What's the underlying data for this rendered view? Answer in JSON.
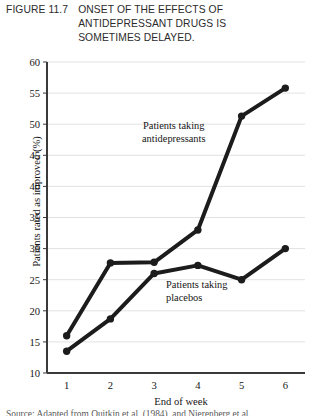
{
  "figure": {
    "number": "FIGURE 11.7",
    "title_lines": [
      "ONSET OF THE EFFECTS OF",
      "ANTIDEPRESSANT DRUGS IS",
      "SOMETIMES DELAYED."
    ]
  },
  "annotations": {
    "antidepressants_line1": "Patients taking",
    "antidepressants_line2": "antidepressants",
    "placebos_line1": "Patients taking",
    "placebos_line2": "placebos"
  },
  "source_credit": "Source: Adapted from Quitkin et al. (1984), and Nierenberg et al.",
  "colors": {
    "line": "#1c1c1c",
    "gridline": "#e2e2e2",
    "axis": "#3a3a3a",
    "text": "#161616",
    "background": "#ffffff"
  },
  "chart_data": {
    "type": "line",
    "title": "ONSET OF THE EFFECTS OF ANTIDEPRESSANT DRUGS IS SOMETIMES DELAYED.",
    "xlabel": "End of week",
    "ylabel": "Patients rated as improved (%)",
    "x": [
      1,
      2,
      3,
      4,
      5,
      6
    ],
    "xticklabels": [
      "1",
      "2",
      "3",
      "4",
      "5",
      "6"
    ],
    "yticks": [
      10,
      15,
      20,
      25,
      30,
      35,
      40,
      45,
      50,
      55,
      60
    ],
    "yticklabels": [
      "10",
      "15",
      "20",
      "25",
      "30",
      "35",
      "40",
      "45",
      "50",
      "55",
      "60"
    ],
    "xlim": [
      0.55,
      6.45
    ],
    "ylim": [
      10,
      60
    ],
    "grid": "horizontal",
    "legend": "inline-annotations",
    "series": [
      {
        "name": "Patients taking antidepressants",
        "values": [
          16.0,
          27.7,
          27.8,
          33.0,
          51.3,
          55.8
        ],
        "marker": "filled-circle",
        "color": "#1c1c1c"
      },
      {
        "name": "Patients taking placebos",
        "values": [
          13.5,
          18.7,
          26.0,
          27.3,
          25.0,
          30.0
        ],
        "marker": "filled-circle",
        "color": "#1c1c1c"
      }
    ]
  }
}
